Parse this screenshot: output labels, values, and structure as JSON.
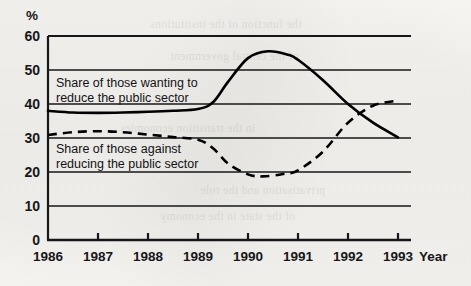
{
  "chart_data": {
    "type": "line",
    "title": "",
    "xlabel": "Year",
    "ylabel": "%",
    "ylim": [
      0,
      60
    ],
    "xlim": [
      1986,
      1993
    ],
    "grid": true,
    "legend_position": "inline-annotation",
    "y_ticks": [
      "0",
      "10",
      "20",
      "30",
      "40",
      "50",
      "60"
    ],
    "x_ticks": [
      "1986",
      "1987",
      "1988",
      "1989",
      "1990",
      "1991",
      "1992",
      "1993"
    ],
    "series": [
      {
        "name": "Share of those wanting to reduce the public sector",
        "style": "solid",
        "color": "#000000",
        "x": [
          1986,
          1986.5,
          1987,
          1987.5,
          1988,
          1988.5,
          1989,
          1989.3,
          1989.6,
          1990,
          1990.4,
          1990.8,
          1991,
          1991.5,
          1992,
          1992.5,
          1993
        ],
        "values": [
          38.0,
          37.5,
          37.4,
          37.5,
          37.7,
          38.0,
          38.5,
          40.5,
          46.5,
          53.5,
          55.5,
          54.5,
          53.0,
          47.0,
          40.0,
          34.5,
          30.2
        ]
      },
      {
        "name": "Share of those against reducing the public sector",
        "style": "dashed",
        "color": "#000000",
        "x": [
          1986,
          1986.5,
          1987,
          1987.5,
          1988,
          1988.5,
          1989,
          1989.3,
          1989.6,
          1990,
          1990.3,
          1990.7,
          1991,
          1991.5,
          1992,
          1992.5,
          1993
        ],
        "values": [
          30.9,
          31.7,
          32.0,
          31.7,
          31.0,
          30.3,
          29.5,
          27.0,
          22.5,
          19.3,
          18.7,
          19.4,
          20.5,
          26.0,
          34.5,
          39.5,
          41.0
        ]
      }
    ],
    "annotations": [
      {
        "name": "annotation-upper",
        "line1": "Share of those wanting to",
        "line2": "reduce the public sector"
      },
      {
        "name": "annotation-lower",
        "line1": "Share of those against",
        "line2": "reducing the public sector"
      }
    ]
  },
  "axis": {
    "unit_label": "%",
    "x_axis_title": "Year"
  },
  "bleed_text": [
    "the function of the institutions",
    "of the central government",
    "in the transition economies",
    "privatisation and the role",
    "of the state in the economy"
  ]
}
